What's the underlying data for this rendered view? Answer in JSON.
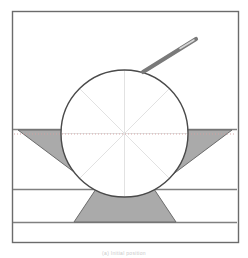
{
  "figure": {
    "title": "",
    "caption": "(a) Initial position",
    "frame": {
      "x": 12,
      "y": 11,
      "width": 226,
      "height": 231,
      "stroke": "#6b6b6b",
      "fill": "#ffffff"
    },
    "colors": {
      "frame_stroke": "#6b6b6b",
      "surface_line": "#808080",
      "disc_stroke": "#4a4a4a",
      "spoke": "#e2e2e2",
      "axis_dotted": "#d2a0a0",
      "shaded_fill": "#aaaaaa",
      "shaded_stroke": "#6b6b6b",
      "needle_body": "#7a7a7a",
      "needle_highlight": "#d8d8d8",
      "background": "#ffffff"
    }
  },
  "disc": {
    "label": "disc",
    "center_x": 124.5,
    "center_y": 133.5,
    "radius": 63.5,
    "spoke_count": 8,
    "spoke_angles_deg": [
      0,
      45,
      90,
      135,
      180,
      225,
      270,
      315
    ]
  },
  "layers": {
    "label": "horizontal strata",
    "lines_y": [
      129,
      189,
      222
    ],
    "names": [
      "surface-line-top",
      "surface-line-middle",
      "surface-line-bottom"
    ]
  },
  "wedges": {
    "left": {
      "label": "left-shaded-wedge",
      "points": "18,130 70,130 78,175"
    },
    "right": {
      "label": "right-shaded-wedge",
      "points": "232,130 180,130 172,175"
    },
    "bottom": {
      "label": "bottom-shaded-trapezoid",
      "points": "74,222 96,189 154,189 176,222"
    }
  },
  "needle": {
    "label": "needle-probe",
    "x1": 143,
    "y1": 72,
    "x2": 196,
    "y2": 39,
    "width": 4.2
  },
  "axis": {
    "label": "horizontal-centerline",
    "y": 133.5,
    "x_start": 14,
    "x_end": 236,
    "dash": "1,2"
  }
}
